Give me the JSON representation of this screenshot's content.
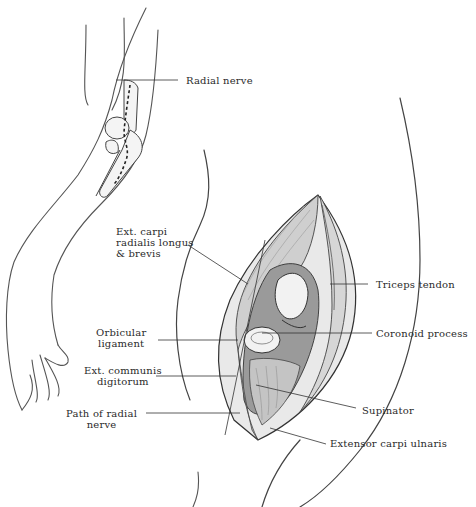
{
  "figure": {
    "colors": {
      "ink": "#2a2a2a",
      "line": "#3a3a3a",
      "shade": "#8a8a8a",
      "background": "#ffffff"
    }
  },
  "labels": {
    "radial_nerve": "Radial nerve",
    "ext_carpi_radialis": "Ext. carpi\nradialis longus\n& brevis",
    "triceps_tendon": "Triceps tendon",
    "orbicular_ligament": "Orbicular\nligament",
    "coronoid_process": "Coronoid process",
    "ext_communis_digitorum": "Ext. communis\ndigitorum",
    "path_of_radial_nerve": "Path of radial\nnerve",
    "supinator": "Supinator",
    "extensor_carpi_ulnaris": "Extensor carpi ulnaris"
  }
}
